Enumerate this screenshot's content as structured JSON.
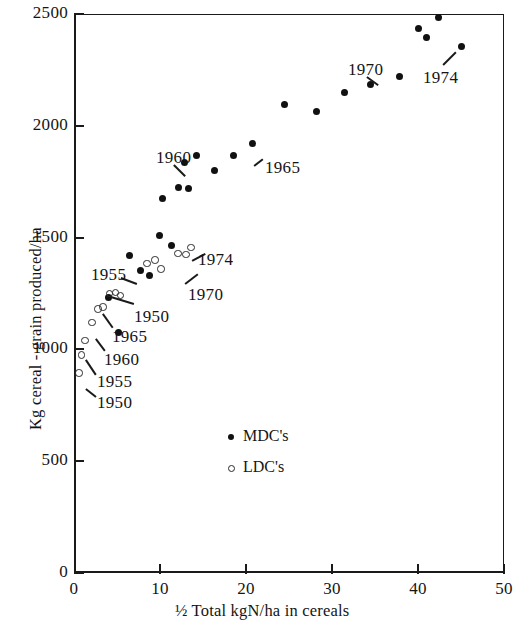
{
  "chart_data": {
    "type": "scatter",
    "title": "",
    "xlabel": "½ Total kgN/ha in cereals",
    "ylabel": "Kg cereal - grain produced/ha",
    "xlim": [
      0,
      50
    ],
    "ylim": [
      0,
      2500
    ],
    "xticks": [
      0,
      10,
      20,
      30,
      40,
      50
    ],
    "yticks": [
      0,
      500,
      1000,
      1500,
      2000,
      2500
    ],
    "grid": false,
    "legend_position": "center-right-inside",
    "legend": [
      {
        "label": "MDC's",
        "marker": "filled-circle"
      },
      {
        "label": "LDC's",
        "marker": "open-circle"
      }
    ],
    "series": [
      {
        "name": "MDC's",
        "marker": "filled-circle",
        "points": [
          {
            "x": 4.0,
            "y": 1230
          },
          {
            "x": 5.2,
            "y": 1075
          },
          {
            "x": 6.4,
            "y": 1418
          },
          {
            "x": 7.7,
            "y": 1355
          },
          {
            "x": 8.8,
            "y": 1330
          },
          {
            "x": 9.9,
            "y": 1510
          },
          {
            "x": 10.3,
            "y": 1675
          },
          {
            "x": 11.3,
            "y": 1465
          },
          {
            "x": 12.2,
            "y": 1725
          },
          {
            "x": 13.3,
            "y": 1720
          },
          {
            "x": 12.9,
            "y": 1838
          },
          {
            "x": 14.2,
            "y": 1865
          },
          {
            "x": 16.3,
            "y": 1800
          },
          {
            "x": 18.5,
            "y": 1865
          },
          {
            "x": 20.8,
            "y": 1920
          },
          {
            "x": 24.5,
            "y": 2095
          },
          {
            "x": 28.2,
            "y": 2065
          },
          {
            "x": 31.5,
            "y": 2150
          },
          {
            "x": 34.5,
            "y": 2185
          },
          {
            "x": 37.8,
            "y": 2220
          },
          {
            "x": 40.1,
            "y": 2435
          },
          {
            "x": 41.0,
            "y": 2395
          },
          {
            "x": 42.4,
            "y": 2485
          },
          {
            "x": 45.0,
            "y": 2355
          }
        ]
      },
      {
        "name": "LDC's",
        "marker": "open-circle",
        "points": [
          {
            "x": 0.6,
            "y": 895
          },
          {
            "x": 0.9,
            "y": 975
          },
          {
            "x": 1.3,
            "y": 1040
          },
          {
            "x": 2.1,
            "y": 1120
          },
          {
            "x": 2.8,
            "y": 1180
          },
          {
            "x": 3.4,
            "y": 1190
          },
          {
            "x": 4.1,
            "y": 1250
          },
          {
            "x": 4.8,
            "y": 1255
          },
          {
            "x": 5.4,
            "y": 1240
          },
          {
            "x": 8.5,
            "y": 1385
          },
          {
            "x": 9.4,
            "y": 1400
          },
          {
            "x": 10.1,
            "y": 1360
          },
          {
            "x": 12.1,
            "y": 1430
          },
          {
            "x": 13.0,
            "y": 1425
          },
          {
            "x": 13.6,
            "y": 1455
          }
        ]
      }
    ],
    "annotations": [
      {
        "text": "1950",
        "series": "LDC's",
        "x": 0.6,
        "y": 895,
        "label_px": [
          97,
          393
        ],
        "leader": [
          [
            86,
            388
          ],
          [
            96,
            396
          ]
        ]
      },
      {
        "text": "1955",
        "series": "LDC's",
        "x": 1.3,
        "y": 1040,
        "label_px": [
          97,
          372
        ],
        "leader": [
          [
            86,
            359
          ],
          [
            96,
            374
          ]
        ]
      },
      {
        "text": "1960",
        "series": "LDC's",
        "x": 2.8,
        "y": 1180,
        "label_px": [
          104,
          350
        ],
        "leader": [
          [
            96,
            338
          ],
          [
            105,
            350
          ]
        ]
      },
      {
        "text": "1965",
        "series": "LDC's",
        "x": 4.1,
        "y": 1250,
        "label_px": [
          112,
          327
        ],
        "leader": [
          [
            103,
            313
          ],
          [
            113,
            327
          ]
        ]
      },
      {
        "text": "1950",
        "series": "MDC's",
        "x": 4.0,
        "y": 1230,
        "label_px": [
          134,
          307
        ],
        "leader": [
          [
            111,
            296
          ],
          [
            134,
            303
          ]
        ]
      },
      {
        "text": "1955",
        "series": "MDC's",
        "x": 6.4,
        "y": 1418,
        "label_px": [
          91,
          265
        ],
        "leader": [
          [
            121,
            277
          ],
          [
            137,
            283
          ]
        ]
      },
      {
        "text": "1970",
        "series": "LDC's",
        "x": 13.0,
        "y": 1425,
        "label_px": [
          188,
          285
        ],
        "leader": [
          [
            185,
            283
          ],
          [
            198,
            273
          ]
        ]
      },
      {
        "text": "1974",
        "series": "LDC's",
        "x": 13.6,
        "y": 1455,
        "label_px": [
          198,
          250
        ],
        "leader": [
          [
            192,
            260
          ],
          [
            205,
            253
          ]
        ]
      },
      {
        "text": "1960",
        "series": "MDC's",
        "x": 12.9,
        "y": 1838,
        "label_px": [
          156,
          148
        ],
        "leader": [
          [
            174,
            164
          ],
          [
            185,
            175
          ]
        ]
      },
      {
        "text": "1965",
        "series": "MDC's",
        "x": 20.8,
        "y": 1920,
        "label_px": [
          265,
          158
        ],
        "leader": [
          [
            254,
            165
          ],
          [
            263,
            158
          ]
        ]
      },
      {
        "text": "1970",
        "series": "MDC's",
        "x": 34.5,
        "y": 2185,
        "label_px": [
          348,
          60
        ],
        "leader": [
          [
            367,
            76
          ],
          [
            378,
            84
          ]
        ]
      },
      {
        "text": "1974",
        "series": "MDC's",
        "x": 45.0,
        "y": 2355,
        "label_px": [
          423,
          68
        ],
        "leader": [
          [
            443,
            64
          ],
          [
            456,
            51
          ]
        ]
      }
    ]
  },
  "axes": {
    "y_tick_labels": [
      "2500",
      "2000",
      "1500",
      "1000",
      "500",
      "0"
    ],
    "x_tick_labels": [
      "0",
      "10",
      "20",
      "30",
      "40",
      "50"
    ],
    "x_axis_title": "½ Total kgN/ha in cereals",
    "y_axis_title": "Kg cereal - grain produced/ha"
  },
  "legend_items": [
    {
      "label": "MDC's",
      "marker": "filled-circle"
    },
    {
      "label": "LDC's",
      "marker": "open-circle"
    }
  ]
}
